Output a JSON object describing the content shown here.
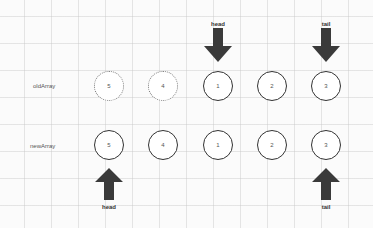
{
  "diagram": {
    "title": "",
    "colors": {
      "background": "#fbfbfb",
      "grid": "#c8c8c8",
      "circle_border": "#333333",
      "dotted_border": "#777777",
      "arrow_fill": "#3a3a3a",
      "text": "#555555"
    },
    "rows": [
      {
        "label": "oldArray",
        "nodes": [
          {
            "value": "5",
            "style": "dotted"
          },
          {
            "value": "4",
            "style": "dotted"
          },
          {
            "value": "1",
            "style": "solid"
          },
          {
            "value": "2",
            "style": "solid"
          },
          {
            "value": "3",
            "style": "solid"
          }
        ],
        "pointers": [
          {
            "label": "head",
            "direction": "down",
            "node_index": 2
          },
          {
            "label": "tail",
            "direction": "down",
            "node_index": 4
          }
        ]
      },
      {
        "label": "newArray",
        "nodes": [
          {
            "value": "5",
            "style": "solid"
          },
          {
            "value": "4",
            "style": "solid"
          },
          {
            "value": "1",
            "style": "solid"
          },
          {
            "value": "2",
            "style": "solid"
          },
          {
            "value": "3",
            "style": "solid"
          }
        ],
        "pointers": [
          {
            "label": "head",
            "direction": "up",
            "node_index": 0
          },
          {
            "label": "tail",
            "direction": "up",
            "node_index": 4
          }
        ]
      }
    ]
  }
}
